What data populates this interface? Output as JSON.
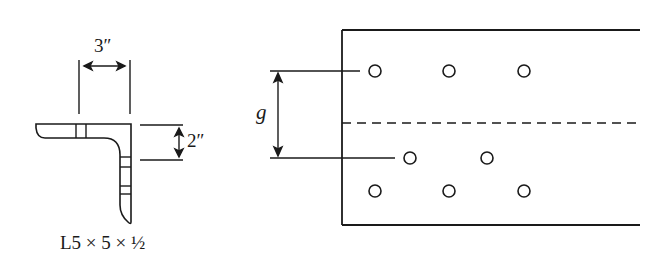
{
  "figure": {
    "type": "structural steel angle connection diagram",
    "left_view": {
      "title": "Angle cross-section",
      "width_dimension": "3″",
      "depth_dimension": "2″",
      "section_label": "L5 × 5 × ½"
    },
    "right_view": {
      "title": "Plan view of angle legs with bolt holes",
      "gage_label": "g",
      "bolt_rows": [
        {
          "row": "top",
          "holes": 3
        },
        {
          "row": "middle",
          "holes": 2
        },
        {
          "row": "bottom",
          "holes": 3
        }
      ],
      "centerline": "dashed"
    },
    "colors": {
      "stroke": "#1a1a1a",
      "background": "#ffffff"
    }
  }
}
